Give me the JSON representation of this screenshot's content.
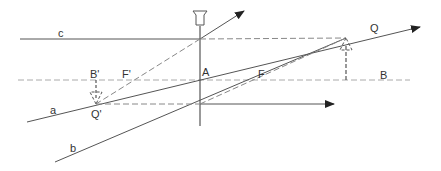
{
  "diagram": {
    "colors": {
      "solid": "#555555",
      "dashed": "#888888",
      "axis": "#aaaaaa",
      "arrowhead": "#222222",
      "label": "#333333"
    },
    "labels": {
      "ray_a": "a",
      "ray_b": "b",
      "ray_c": "c",
      "point_A": "A",
      "point_B": "B",
      "point_B_prime": "B'",
      "point_F": "F",
      "point_F_prime": "F'",
      "point_Q": "Q",
      "point_Q_prime": "Q'"
    }
  }
}
